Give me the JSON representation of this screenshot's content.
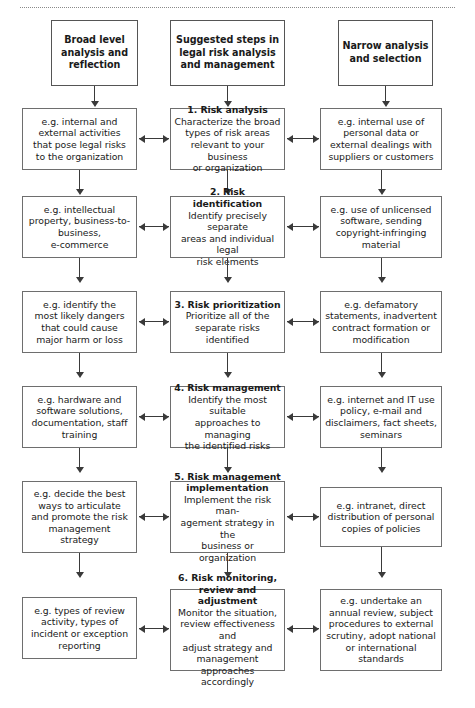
{
  "figure": {
    "columns": [
      {
        "id": "left",
        "header": "Broad level\nanalysis and\nreflection"
      },
      {
        "id": "middle",
        "header": "Suggested steps in\nlegal risk analysis\nand management"
      },
      {
        "id": "right",
        "header": "Narrow analysis\nand selection"
      }
    ],
    "rows": [
      {
        "left": "e.g. internal and\nexternal activities\nthat pose legal risks\nto the organization",
        "middle_title": "1. Risk analysis",
        "middle_body": "Characterize the broad\ntypes of risk areas\nrelevant to your business\nor organization",
        "right": "e.g. internal use of\npersonal data or\nexternal dealings with\nsuppliers or customers"
      },
      {
        "left": "e.g. intellectual\nproperty, business-to-\nbusiness,\ne-commerce",
        "middle_title": "2. Risk identification",
        "middle_body": "Identify precisely separate\nareas and individual legal\nrisk elements",
        "right": "e.g. use of unlicensed\nsoftware, sending\ncopyright-infringing\nmaterial"
      },
      {
        "left": "e.g. identify the\nmost likely dangers\nthat could cause\nmajor harm or loss",
        "middle_title": "3. Risk prioritization",
        "middle_body": "Prioritize all of the\nseparate risks identified",
        "right": "e.g. defamatory\nstatements, inadvertent\ncontract formation or\nmodification"
      },
      {
        "left": "e.g. hardware and\nsoftware solutions,\ndocumentation, staff\ntraining",
        "middle_title": "4. Risk management",
        "middle_body": "Identify the most suitable\napproaches to managing\nthe identified risks",
        "right": "e.g. internet and IT use\npolicy, e-mail and\ndisclaimers, fact sheets,\nseminars"
      },
      {
        "left": "e.g. decide the best\nways to articulate\nand promote the risk\nmanagement\nstrategy",
        "middle_title": "5. Risk management\nimplementation",
        "middle_body": "Implement the risk man-\nagement strategy in the\nbusiness or organization",
        "right": "e.g. intranet, direct\ndistribution of personal\ncopies of policies"
      },
      {
        "left": "e.g. types of review\nactivity, types of\nincident or exception\nreporting",
        "middle_title": "6. Risk monitoring,\nreview and adjustment",
        "middle_body": "Monitor the situation,\nreview effectiveness and\nadjust strategy and\nmanagement approaches\naccordingly",
        "right": "e.g. undertake an\nannual review, subject\nprocedures to external\nscrutiny, adopt national\nor international\nstandards"
      }
    ],
    "colors": {
      "box_border": "#6e6e6e",
      "arrow": "#3a3a3a",
      "text": "#1a1a1a",
      "rule": "#8a8a8a",
      "background": "#ffffff"
    }
  }
}
